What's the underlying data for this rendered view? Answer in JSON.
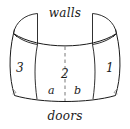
{
  "figure": {
    "type": "line-diagram",
    "stroke_color": "#1a1a1a",
    "fill_color": "#ffffff",
    "background_color": "#ffffff",
    "captions": {
      "top": "walls",
      "bottom": "doors"
    },
    "panels": [
      {
        "id": "left",
        "label": "3"
      },
      {
        "id": "center",
        "label": "2"
      },
      {
        "id": "right",
        "label": "1"
      }
    ],
    "center_subdivisions": [
      {
        "id": "center-left",
        "label": "a"
      },
      {
        "id": "center-right",
        "label": "b"
      }
    ],
    "divider": {
      "style": "dashed",
      "orientation": "vertical",
      "name": "center-dashed-divider"
    },
    "flaps": [
      {
        "id": "top-left-flap"
      },
      {
        "id": "top-right-flap"
      }
    ]
  }
}
